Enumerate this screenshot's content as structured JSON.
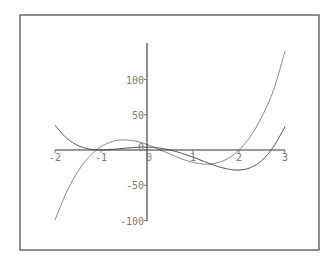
{
  "chart_data": {
    "type": "line",
    "title": "",
    "xlabel": "",
    "ylabel": "",
    "xlim": [
      -2,
      3
    ],
    "ylim": [
      -100,
      145
    ],
    "grid": false,
    "legend": null,
    "x_ticks": [
      -2,
      -1,
      0,
      1,
      2,
      3
    ],
    "y_ticks": [
      -100,
      -50,
      0,
      50,
      100
    ],
    "x_tick_labels": [
      "-2",
      "-1",
      "0",
      "1",
      "2",
      "3"
    ],
    "y_tick_labels": [
      "-100",
      "-50",
      "0",
      "50",
      "100"
    ],
    "x": [
      -2,
      -1.75,
      -1.5,
      -1.25,
      -1,
      -0.75,
      -0.5,
      -0.25,
      0,
      0.25,
      0.5,
      0.75,
      1,
      1.25,
      1.5,
      1.75,
      2,
      2.25,
      2.5,
      2.75,
      3
    ],
    "series": [
      {
        "name": "curve-1",
        "color": "#8a8a8a",
        "values": [
          -99.4,
          -60.0,
          -30.2,
          -9.1,
          4.7,
          12.1,
          14.4,
          12.6,
          7.9,
          1.4,
          -5.8,
          -12.5,
          -17.6,
          -20.1,
          -18.7,
          -12.4,
          0,
          19.6,
          47.5,
          84.9,
          140
        ]
      },
      {
        "name": "curve-2",
        "color": "#555555",
        "values": [
          35.3,
          16.9,
          6.3,
          1.3,
          0,
          0.8,
          2.4,
          3.7,
          4.1,
          2.9,
          0,
          -4.5,
          -10.2,
          -16.5,
          -22.5,
          -26.9,
          -28.4,
          -25.0,
          -14.7,
          4.7,
          33
        ]
      }
    ]
  },
  "frame": {
    "border_color": "#444444"
  },
  "axes": {
    "color": "#333333"
  }
}
